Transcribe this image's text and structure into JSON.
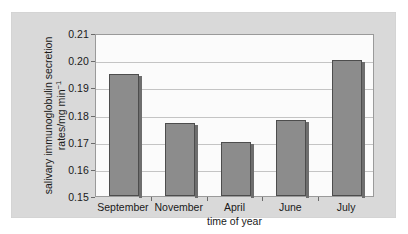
{
  "chart_data": {
    "type": "bar",
    "title": "",
    "categories": [
      "September",
      "November",
      "April",
      "June",
      "July"
    ],
    "values": [
      0.195,
      0.177,
      0.17,
      0.178,
      0.2
    ],
    "series": [
      {
        "name": "salivary immunoglobulin secretion rate",
        "values": [
          0.195,
          0.177,
          0.17,
          0.178,
          0.2
        ]
      }
    ],
    "xlabel": "time of year",
    "ylabel_line1": "salivary immunoglobulin secretion",
    "ylabel_line2_prefix": "rates/mg min",
    "ylabel_line2_sup": "−1",
    "ylim": [
      0.15,
      0.21
    ],
    "ytick_values": [
      0.15,
      0.16,
      0.17,
      0.18,
      0.19,
      0.2,
      0.21
    ],
    "ytick_labels": [
      "0.15",
      "0.16",
      "0.17",
      "0.18",
      "0.19",
      "0.20",
      "0.21"
    ],
    "grid": true,
    "legend": "none",
    "bar_color": "#8c8c8c",
    "bar_edge_color": "#4d4d4d",
    "plot_bg_color": "#fbfbfb",
    "panel_bg_color": "#d9d9d9",
    "gridline_color": "#c4c4c4",
    "axis_color": "#9a9a9a"
  }
}
